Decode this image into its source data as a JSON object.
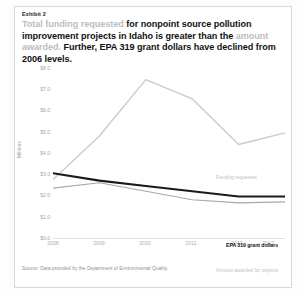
{
  "exhibit": {
    "label": "Exhibit 2"
  },
  "headline": {
    "seg1": "Total funding requested",
    "seg2": " for nonpoint source pollution improvement projects in Idaho is greater than the ",
    "seg3": "amount awarded.",
    "seg4": " Further, EPA 319 grant dollars have declined from 2006 levels."
  },
  "source": {
    "text": "Source: Data provided by the Department of Environmental Quality."
  },
  "colors": {
    "funding_requested": "#c9c9c9",
    "amount_awarded": "#a8a8a8",
    "epa_grant": "#1a1a1a",
    "axis": "#e2e2e2",
    "tick_text": "#a8a8a8"
  },
  "chart_data": {
    "type": "line",
    "title": "",
    "xlabel": "",
    "ylabel": "Millions",
    "categories": [
      "2008",
      "2009",
      "2010",
      "2011",
      "2012",
      "2013"
    ],
    "ylim": [
      0.0,
      8.0
    ],
    "yticks": [
      "$8.0",
      "$7.0",
      "$6.0",
      "$5.0",
      "$4.0",
      "$3.0",
      "$2.0",
      "$1.0",
      "$0.0"
    ],
    "ytick_values": [
      8.0,
      7.0,
      6.0,
      5.0,
      4.0,
      3.0,
      2.0,
      1.0,
      0.0
    ],
    "grid": false,
    "legend": "inline-labels",
    "series": [
      {
        "name": "Funding requested",
        "color": "#c9c9c9",
        "values": [
          2.75,
          4.8,
          7.45,
          6.55,
          4.4,
          4.95
        ]
      },
      {
        "name": "EPA 319 grant dollars",
        "color": "#1a1a1a",
        "values": [
          3.05,
          2.7,
          2.45,
          2.2,
          1.95,
          1.95
        ]
      },
      {
        "name": "Amount awarded for projects",
        "color": "#a8a8a8",
        "values": [
          2.35,
          2.6,
          2.2,
          1.8,
          1.65,
          1.7
        ]
      }
    ]
  }
}
